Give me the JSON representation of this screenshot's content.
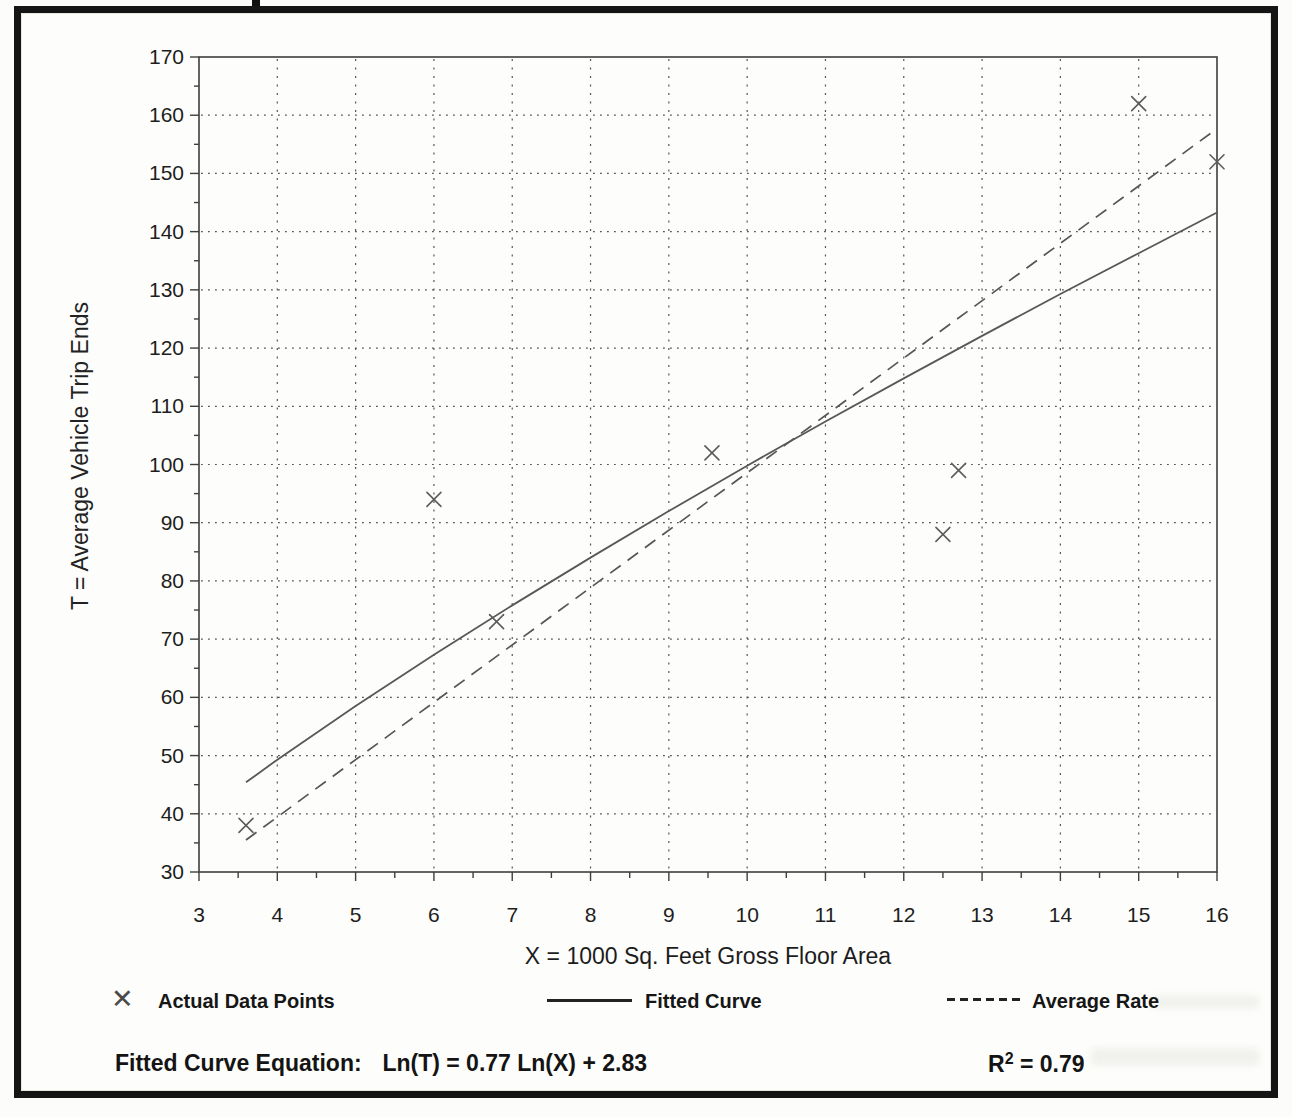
{
  "document": {
    "equation_label": "Fitted Curve Equation:",
    "equation_value": "Ln(T) = 0.77 Ln(X) + 2.83",
    "r_squared_base": "R",
    "r_squared_sup": "2",
    "r_squared_rest": " = 0.79"
  },
  "legend": {
    "marker_glyph": "✕",
    "items": [
      {
        "label": "Actual Data Points",
        "marker": "x-cross"
      },
      {
        "label": "Fitted Curve",
        "marker": "solid-line"
      },
      {
        "label": "Average Rate",
        "marker": "dashed-line"
      }
    ]
  },
  "chart_data": {
    "type": "scatter",
    "title": "",
    "xlabel": "X = 1000 Sq. Feet Gross Floor Area",
    "ylabel": "T = Average Vehicle Trip Ends",
    "xlim": [
      3,
      16
    ],
    "ylim": [
      30,
      170
    ],
    "x_ticks": [
      3,
      4,
      5,
      6,
      7,
      8,
      9,
      10,
      11,
      12,
      13,
      14,
      15,
      16
    ],
    "y_ticks": [
      30,
      40,
      50,
      60,
      70,
      80,
      90,
      100,
      110,
      120,
      130,
      140,
      150,
      160,
      170
    ],
    "x_minor_step": 0.5,
    "y_minor_step": 5,
    "grid": "dotted",
    "legend_position": "below",
    "r_squared": 0.79,
    "series": [
      {
        "name": "Actual Data Points",
        "type": "scatter",
        "marker": "x",
        "points": [
          [
            3.6,
            38
          ],
          [
            6.0,
            94
          ],
          [
            6.8,
            73
          ],
          [
            9.55,
            102
          ],
          [
            12.5,
            88
          ],
          [
            12.7,
            99
          ],
          [
            15.0,
            162
          ],
          [
            16.0,
            152
          ]
        ]
      },
      {
        "name": "Fitted Curve",
        "type": "line",
        "style": "solid",
        "equation": "Ln(T) = 0.77 Ln(X) + 2.83",
        "x": [
          3.6,
          4,
          5,
          6,
          7,
          8,
          9,
          10,
          11,
          12,
          13,
          14,
          15,
          16
        ],
        "y": [
          45.4,
          49.3,
          58.5,
          67.3,
          75.8,
          84.0,
          92.0,
          99.8,
          107.4,
          114.8,
          122.1,
          129.3,
          136.3,
          143.3
        ]
      },
      {
        "name": "Average Rate",
        "type": "line",
        "style": "dashed",
        "x": [
          3.6,
          16
        ],
        "y": [
          35.5,
          157.7
        ]
      }
    ]
  }
}
